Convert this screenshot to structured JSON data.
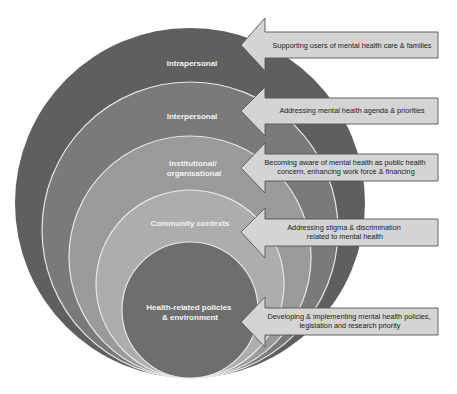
{
  "diagram": {
    "type": "nested-circles-with-arrows",
    "colors": {
      "ring_1": "#5e5e5e",
      "ring_2": "#7a7a7a",
      "ring_3": "#9a9a9a",
      "ring_4": "#adadad",
      "ring_5": "#6e6e6e",
      "ring_stroke": "#e8e8e8",
      "arrow_fill": "#d4d4d4",
      "arrow_stroke": "#555555",
      "label_text": "#f4f4f4",
      "arrow_text": "#222222"
    },
    "levels": [
      {
        "label_lines": [
          "Intrapersonal"
        ],
        "arrow_lines": [
          "Supporting users of mental health care & families"
        ]
      },
      {
        "label_lines": [
          "Interpersonal"
        ],
        "arrow_lines": [
          "Addressing mental health agenda & priorities"
        ]
      },
      {
        "label_lines": [
          "Institutional/",
          "organisational"
        ],
        "arrow_lines": [
          "Becoming aware of mental health as public health",
          "concern, enhancing work force & financing"
        ]
      },
      {
        "label_lines": [
          "Community contexts"
        ],
        "arrow_lines": [
          "Addressing stigma & discrimination",
          "related to mental health"
        ]
      },
      {
        "label_lines": [
          "Health-related policies",
          "& environment"
        ],
        "arrow_lines": [
          "Developing & implementing mental health policies,",
          "legislation and research priority"
        ]
      }
    ]
  }
}
